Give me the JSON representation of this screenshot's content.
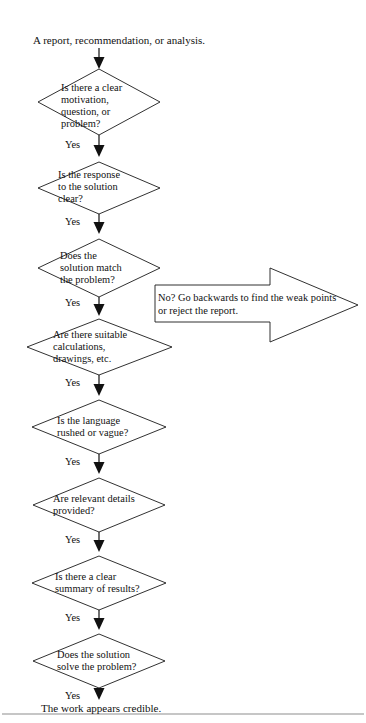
{
  "document": {
    "title": "A report, recommendation, or analysis.",
    "background_color": "#ffffff",
    "line_color": "#1a1a1a",
    "text_color": "#111111"
  },
  "start": {
    "label": "A report, recommendation, or analysis."
  },
  "decisions": [
    {
      "id": "clear-motivation",
      "lines": [
        "Is there a clear",
        "motivation,",
        "question, or",
        "problem?"
      ],
      "text": "Is there a clear motivation, question, or problem?",
      "yes_label": "Yes"
    },
    {
      "id": "response-clear",
      "lines": [
        "Is the response",
        "to the solution",
        "clear?"
      ],
      "text": "Is the response to the solution clear?",
      "yes_label": "Yes"
    },
    {
      "id": "solution-match",
      "lines": [
        "Does the",
        "solution match",
        "the problem?"
      ],
      "text": "Does the solution match the problem?",
      "yes_label": "Yes"
    },
    {
      "id": "suitable-calculations",
      "lines": [
        "Are there suitable",
        "calculations,",
        "drawings, etc."
      ],
      "text": "Are there suitable calculations, drawings, etc.",
      "yes_label": "Yes"
    },
    {
      "id": "language-rushed",
      "lines": [
        "Is the language",
        "rushed or vague?"
      ],
      "text": "Is the language rushed or vague?",
      "yes_label": "Yes"
    },
    {
      "id": "relevant-details",
      "lines": [
        "Are relevant details",
        "provided?"
      ],
      "text": "Are relevant details provided?",
      "yes_label": "Yes"
    },
    {
      "id": "summary-of-results",
      "lines": [
        "Is there a clear",
        "summary of results?"
      ],
      "text": "Is there a clear summary of results?",
      "yes_label": "Yes"
    },
    {
      "id": "solve-problem",
      "lines": [
        "Does the solution",
        "solve the problem?"
      ],
      "text": "Does the solution solve the problem?",
      "yes_label": "Yes"
    }
  ],
  "end": {
    "label": "The work appears credible."
  },
  "callout_arrow": {
    "lines": [
      "No? Go backwards to find the weak points",
      "or reject the report."
    ],
    "text": "No? Go backwards to find the weak points or reject the report.",
    "direction": "right"
  }
}
